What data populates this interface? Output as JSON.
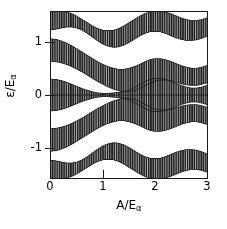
{
  "figure": {
    "kind": "band-structure-plot",
    "background": "#ffffff",
    "band_fill": "#1f1f1f",
    "axis_color": "#1a1a1a"
  },
  "axes": {
    "x_title_main": "A/E",
    "x_title_sub": "α",
    "y_title_main": "ε/E",
    "y_title_sub": "α",
    "x_ticks": [
      "0",
      "1",
      "2",
      "3"
    ],
    "y_ticks": [
      "1",
      "0",
      "-1"
    ]
  },
  "chart_data": {
    "type": "area",
    "title": "",
    "xlabel": "A/Eα",
    "ylabel": "ε/Eα",
    "xlim": [
      0,
      3
    ],
    "ylim": [
      -1.55,
      1.55
    ],
    "xticks": [
      0,
      1,
      2,
      3
    ],
    "yticks": [
      -1,
      0,
      1
    ],
    "grid": false,
    "legend": null,
    "x_samples": [
      0.0,
      0.1,
      0.2,
      0.3,
      0.4,
      0.5,
      0.6,
      0.7,
      0.8,
      0.9,
      1.0,
      1.1,
      1.2,
      1.3,
      1.4,
      1.5,
      1.6,
      1.7,
      1.8,
      1.9,
      2.0,
      2.1,
      2.2,
      2.3,
      2.4,
      2.5,
      2.6,
      2.7,
      2.8,
      2.9,
      3.0
    ],
    "series": [
      {
        "name": "band-1-upper-edge",
        "upper": [
          1.55,
          1.56,
          1.56,
          1.55,
          1.52,
          1.47,
          1.41,
          1.35,
          1.29,
          1.24,
          1.21,
          1.2,
          1.21,
          1.24,
          1.29,
          1.35,
          1.41,
          1.47,
          1.52,
          1.55,
          1.56,
          1.56,
          1.55,
          1.52,
          1.48,
          1.44,
          1.41,
          1.39,
          1.39,
          1.41,
          1.44
        ],
        "lower": [
          1.22,
          1.23,
          1.25,
          1.27,
          1.27,
          1.25,
          1.21,
          1.15,
          1.08,
          1.01,
          0.95,
          0.91,
          0.89,
          0.9,
          0.93,
          0.98,
          1.04,
          1.1,
          1.15,
          1.18,
          1.19,
          1.18,
          1.15,
          1.11,
          1.07,
          1.04,
          1.02,
          1.02,
          1.03,
          1.06,
          1.1
        ]
      },
      {
        "name": "band-2",
        "upper": [
          1.05,
          1.04,
          1.01,
          0.97,
          0.92,
          0.86,
          0.8,
          0.74,
          0.68,
          0.62,
          0.57,
          0.53,
          0.5,
          0.48,
          0.48,
          0.5,
          0.53,
          0.57,
          0.62,
          0.66,
          0.68,
          0.68,
          0.66,
          0.63,
          0.59,
          0.55,
          0.52,
          0.5,
          0.5,
          0.52,
          0.55
        ],
        "lower": [
          0.63,
          0.62,
          0.6,
          0.57,
          0.53,
          0.48,
          0.43,
          0.37,
          0.31,
          0.25,
          0.2,
          0.15,
          0.11,
          0.08,
          0.06,
          0.06,
          0.08,
          0.12,
          0.17,
          0.22,
          0.26,
          0.28,
          0.28,
          0.27,
          0.24,
          0.21,
          0.19,
          0.18,
          0.18,
          0.2,
          0.23
        ]
      },
      {
        "name": "band-3-upper-half",
        "upper": [
          0.3,
          0.29,
          0.27,
          0.24,
          0.2,
          0.16,
          0.12,
          0.09,
          0.06,
          0.04,
          0.03,
          0.03,
          0.04,
          0.05,
          0.06,
          0.09,
          0.14,
          0.19,
          0.25,
          0.29,
          0.31,
          0.31,
          0.29,
          0.26,
          0.22,
          0.18,
          0.15,
          0.13,
          0.13,
          0.15,
          0.18
        ],
        "lower": [
          0.0,
          0.0,
          0.0,
          0.0,
          0.0,
          0.0,
          0.0,
          0.0,
          0.0,
          0.0,
          0.0,
          0.0,
          0.0,
          0.0,
          0.0,
          0.0,
          0.0,
          0.0,
          0.0,
          0.0,
          0.0,
          0.0,
          0.0,
          0.0,
          0.0,
          0.0,
          0.0,
          0.0,
          0.0,
          0.0,
          0.0
        ]
      }
    ]
  }
}
